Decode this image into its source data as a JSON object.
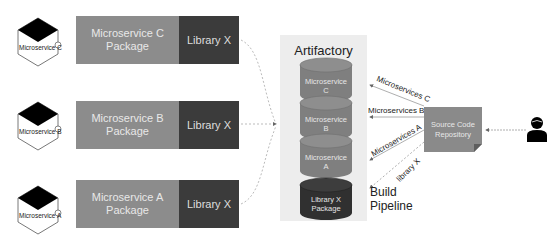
{
  "microservices": [
    {
      "icon_label": "Microservice C",
      "package_label": "Microservice C\nPackage",
      "package_line1": "Microservice C",
      "package_line2": "Package",
      "library_label": "Library X"
    },
    {
      "icon_label": "Microservice B",
      "package_label": "Microservice B\nPackage",
      "package_line1": "Microservice B",
      "package_line2": "Package",
      "library_label": "Library X"
    },
    {
      "icon_label": "Microservice A",
      "package_label": "Microservice A\nPackage",
      "package_line1": "Microservice A",
      "package_line2": "Package",
      "library_label": "Library X"
    }
  ],
  "artifactory": {
    "title": "Artifactory",
    "stores": [
      {
        "line1": "Microservice",
        "line2": "C"
      },
      {
        "line1": "Microservice",
        "line2": "B"
      },
      {
        "line1": "Microservice",
        "line2": "A"
      },
      {
        "line1": "Library X",
        "line2": "Package"
      }
    ]
  },
  "arrows": {
    "ms_c": "Microservices C",
    "ms_b": "Microservices B",
    "ms_a": "Microservices A",
    "lib_x": "library X"
  },
  "repository": {
    "line1": "Source Code",
    "line2": "Repository"
  },
  "build_pipeline": {
    "line1": "Build",
    "line2": "Pipeline"
  },
  "icons": {
    "microservice": "hexagon-microservice-icon",
    "developer": "person-icon"
  },
  "colors": {
    "package": "#8c8c8c",
    "library": "#3b3b3b",
    "artifactory_bg": "#ededed",
    "repository": "#8a8a8a",
    "arrow": "#999999"
  }
}
